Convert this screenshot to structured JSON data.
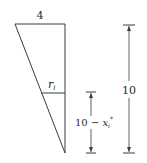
{
  "diagram": {
    "type": "geometry-figure",
    "labels": {
      "top_width": "4",
      "radius": "r",
      "radius_sub": "i",
      "small_dim_prefix": "10 − ",
      "small_dim_var": "x",
      "small_dim_sub": "i",
      "small_dim_sup": "*",
      "total_height": "10"
    },
    "colors": {
      "line": "#3a3a3a",
      "text": "#2a2a2a",
      "background": "#ffffff"
    }
  }
}
